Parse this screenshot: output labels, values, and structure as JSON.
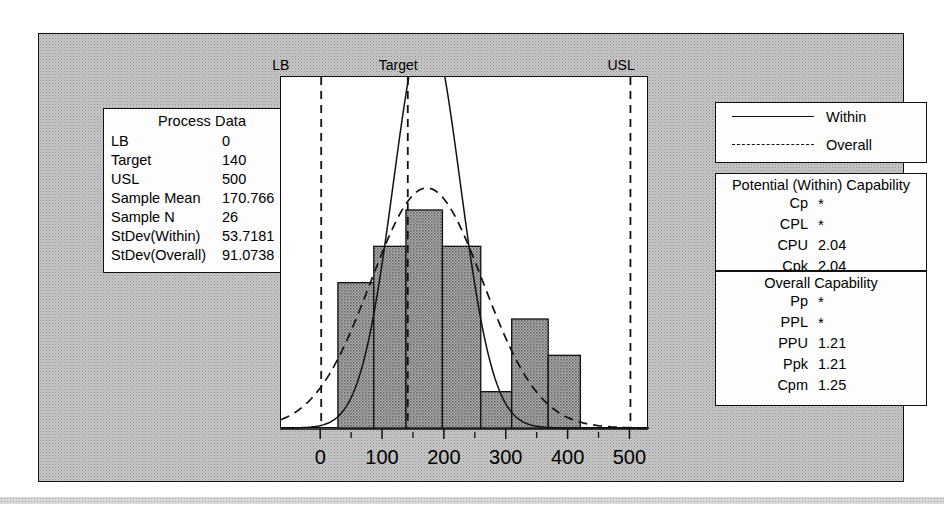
{
  "chart_data": {
    "type": "bar",
    "xlabel": "",
    "ylabel": "",
    "xlim": [
      -65,
      530
    ],
    "grid": false,
    "legend_position": "top-right",
    "bin_edges": [
      27,
      85,
      137,
      196,
      258,
      308,
      367,
      419
    ],
    "categories": [
      "27-85",
      "85-137",
      "137-196",
      "196-258",
      "258-308",
      "308-367",
      "367-419"
    ],
    "values": [
      4,
      5,
      6,
      5,
      1,
      3,
      2
    ],
    "series": [
      {
        "name": "Within",
        "style": "solid",
        "mean": 170.766,
        "sd": 53.7181
      },
      {
        "name": "Overall",
        "style": "dashed",
        "mean": 170.766,
        "sd": 91.0738
      }
    ],
    "annotations": [
      {
        "label": "LB",
        "value": 0
      },
      {
        "label": "Target",
        "value": 140
      },
      {
        "label": "USL",
        "value": 500
      }
    ],
    "xticks": [
      0,
      100,
      200,
      300,
      400,
      500
    ],
    "xtick_labels": [
      "0",
      "100",
      "200",
      "300",
      "400",
      "500"
    ],
    "xminor_ticks": [
      50,
      150,
      250,
      350,
      450
    ]
  },
  "spec_labels": {
    "lb": "LB",
    "target": "Target",
    "usl": "USL"
  },
  "process_data": {
    "title": "Process Data",
    "rows": [
      {
        "label": "LB",
        "value": "0"
      },
      {
        "label": "Target",
        "value": "140"
      },
      {
        "label": "USL",
        "value": "500"
      },
      {
        "label": "Sample Mean",
        "value": "170.766"
      },
      {
        "label": "Sample N",
        "value": "26"
      },
      {
        "label": "StDev(Within)",
        "value": "53.7181"
      },
      {
        "label": "StDev(Overall)",
        "value": "91.0738"
      }
    ]
  },
  "legend": {
    "items": [
      {
        "label": "Within",
        "style": "solid"
      },
      {
        "label": "Overall",
        "style": "dashed"
      }
    ]
  },
  "within_capability": {
    "title": "Potential (Within) Capability",
    "rows": [
      {
        "label": "Cp",
        "value": "*"
      },
      {
        "label": "CPL",
        "value": "*"
      },
      {
        "label": "CPU",
        "value": "2.04"
      },
      {
        "label": "Cpk",
        "value": "2.04"
      }
    ]
  },
  "overall_capability": {
    "title": "Overall Capability",
    "rows": [
      {
        "label": "Pp",
        "value": "*"
      },
      {
        "label": "PPL",
        "value": "*"
      },
      {
        "label": "PPU",
        "value": "1.21"
      },
      {
        "label": "Ppk",
        "value": "1.21"
      },
      {
        "label": "Cpm",
        "value": "1.25"
      }
    ]
  },
  "colors": {
    "ink": "#111111",
    "bar_fill": "#8a8a8a",
    "panel_bg": "#c9c9c9",
    "plot_bg": "#ffffff"
  }
}
